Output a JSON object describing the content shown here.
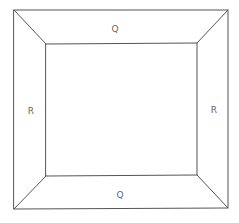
{
  "diagram": {
    "type": "frustum-top-view",
    "outer_square": {
      "x1": 14,
      "y1": 10,
      "x2": 228,
      "y2": 209
    },
    "inner_square": {
      "x1": 46,
      "y1": 44,
      "x2": 197,
      "y2": 176
    },
    "line_color": "#555555",
    "label_color": "#666666",
    "labels": {
      "top": {
        "text": "Q",
        "x": 115,
        "y": 29
      },
      "bottom": {
        "text": "Q",
        "x": 120,
        "y": 195
      },
      "left": {
        "text": "R",
        "x": 31,
        "y": 111
      },
      "right": {
        "text": "R",
        "x": 214,
        "y": 110
      }
    }
  }
}
